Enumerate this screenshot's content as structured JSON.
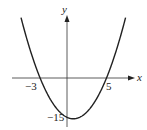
{
  "chart_data": {
    "type": "line",
    "title": "",
    "xlabel": "x",
    "ylabel": "y",
    "function": "y = (x + 3)(x - 5) = x^2 - 2x - 15",
    "annotations": {
      "x_intercepts": [
        -3,
        5
      ],
      "y_intercept": -15
    },
    "tick_labels": {
      "x": [
        "-3",
        "5"
      ],
      "y": [
        "-15"
      ]
    },
    "x": [
      -6,
      -5,
      -4,
      -3,
      -2,
      -1,
      0,
      1,
      2,
      3,
      4,
      5,
      6,
      7,
      8
    ],
    "values": [
      33,
      20,
      9,
      0,
      -7,
      -12,
      -15,
      -16,
      -15,
      -12,
      -7,
      0,
      9,
      20,
      33
    ],
    "grid": false,
    "legend": null,
    "color": "#222222"
  },
  "labels": {
    "x_axis": "x",
    "y_axis": "y",
    "neg3": "−3",
    "five": "5",
    "neg15": "−15"
  }
}
